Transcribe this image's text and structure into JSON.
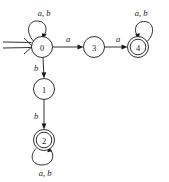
{
  "figure": {
    "name": "finite-automaton-diagram",
    "ink_color": "#1a1a1a",
    "background_color": "#ffffff"
  },
  "states": [
    {
      "id": "0",
      "label": "0",
      "cx": 42,
      "cy": 47,
      "r": 10.5,
      "accepting": false,
      "start": true
    },
    {
      "id": "3",
      "label": "3",
      "cx": 94,
      "cy": 47,
      "r": 10.5,
      "accepting": false,
      "start": false
    },
    {
      "id": "4",
      "label": "4",
      "cx": 138,
      "cy": 47,
      "r": 10.5,
      "accepting": true,
      "start": false
    },
    {
      "id": "1",
      "label": "1",
      "cx": 44,
      "cy": 89,
      "r": 10.5,
      "accepting": false,
      "start": false
    },
    {
      "id": "2",
      "label": "2",
      "cx": 44,
      "cy": 140,
      "r": 10.5,
      "accepting": true,
      "start": false
    }
  ],
  "transitions": [
    {
      "id": "t0-self",
      "from": "0",
      "to": "0",
      "label": "a, b",
      "label_x": 44,
      "label_y": 13,
      "kind": "self-loop"
    },
    {
      "id": "t0-3",
      "from": "0",
      "to": "3",
      "label": "a",
      "label_x": 68,
      "label_y": 39,
      "kind": "edge"
    },
    {
      "id": "t3-4",
      "from": "3",
      "to": "4",
      "label": "a",
      "label_x": 118,
      "label_y": 39,
      "kind": "edge"
    },
    {
      "id": "t4-self",
      "from": "4",
      "to": "4",
      "label": "a, b",
      "label_x": 141,
      "label_y": 13,
      "kind": "self-loop"
    },
    {
      "id": "t0-1",
      "from": "0",
      "to": "1",
      "label": "b",
      "label_x": 36,
      "label_y": 68,
      "kind": "edge"
    },
    {
      "id": "t1-2",
      "from": "1",
      "to": "2",
      "label": "b",
      "label_x": 36,
      "label_y": 116,
      "kind": "edge"
    },
    {
      "id": "t2-self",
      "from": "2",
      "to": "2",
      "label": "a, b",
      "label_x": 45,
      "label_y": 173,
      "kind": "self-loop"
    }
  ],
  "start_marker": {
    "name": "start-arrow",
    "description": "double-line arrow entering state 0"
  }
}
